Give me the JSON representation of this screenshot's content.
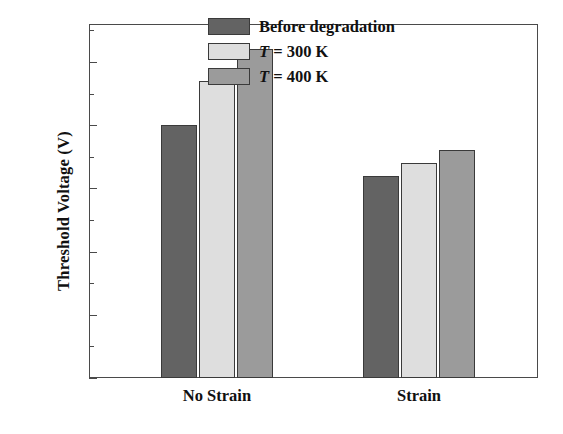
{
  "chart_data": {
    "type": "bar",
    "title": "",
    "xlabel": "",
    "ylabel": "Threshold Voltage (V)",
    "categories": [
      "No Strain",
      "Strain"
    ],
    "series": [
      {
        "name": "Before degradation",
        "values": [
          0.4,
          0.32
        ],
        "color": "#636363"
      },
      {
        "name": "T = 300 K",
        "values": [
          0.47,
          0.34
        ],
        "color": "#dedede"
      },
      {
        "name": "T = 400 K",
        "values": [
          0.52,
          0.36
        ],
        "color": "#9b9b9b"
      }
    ],
    "ylim": [
      0.0,
      0.56
    ],
    "ytick_labels": [
      "0.0",
      "0.1",
      "0.2",
      "0.3",
      "0.4",
      "0.5"
    ],
    "ytick_values": [
      0.0,
      0.1,
      0.2,
      0.3,
      0.4,
      0.5
    ],
    "yminor_values": [
      0.05,
      0.15,
      0.25,
      0.35,
      0.45,
      0.55
    ],
    "grid": false,
    "legend_position": "top-right",
    "legend_entries": [
      {
        "label": "Before degradation",
        "italic_prefix": "",
        "color": "#636363"
      },
      {
        "label": " = 300 K",
        "italic_prefix": "T",
        "color": "#dedede"
      },
      {
        "label": " = 400 K",
        "italic_prefix": "T",
        "color": "#9b9b9b"
      }
    ],
    "axis_color": "#4a4a4a",
    "bar_edge_color": "#3a3a3a"
  }
}
